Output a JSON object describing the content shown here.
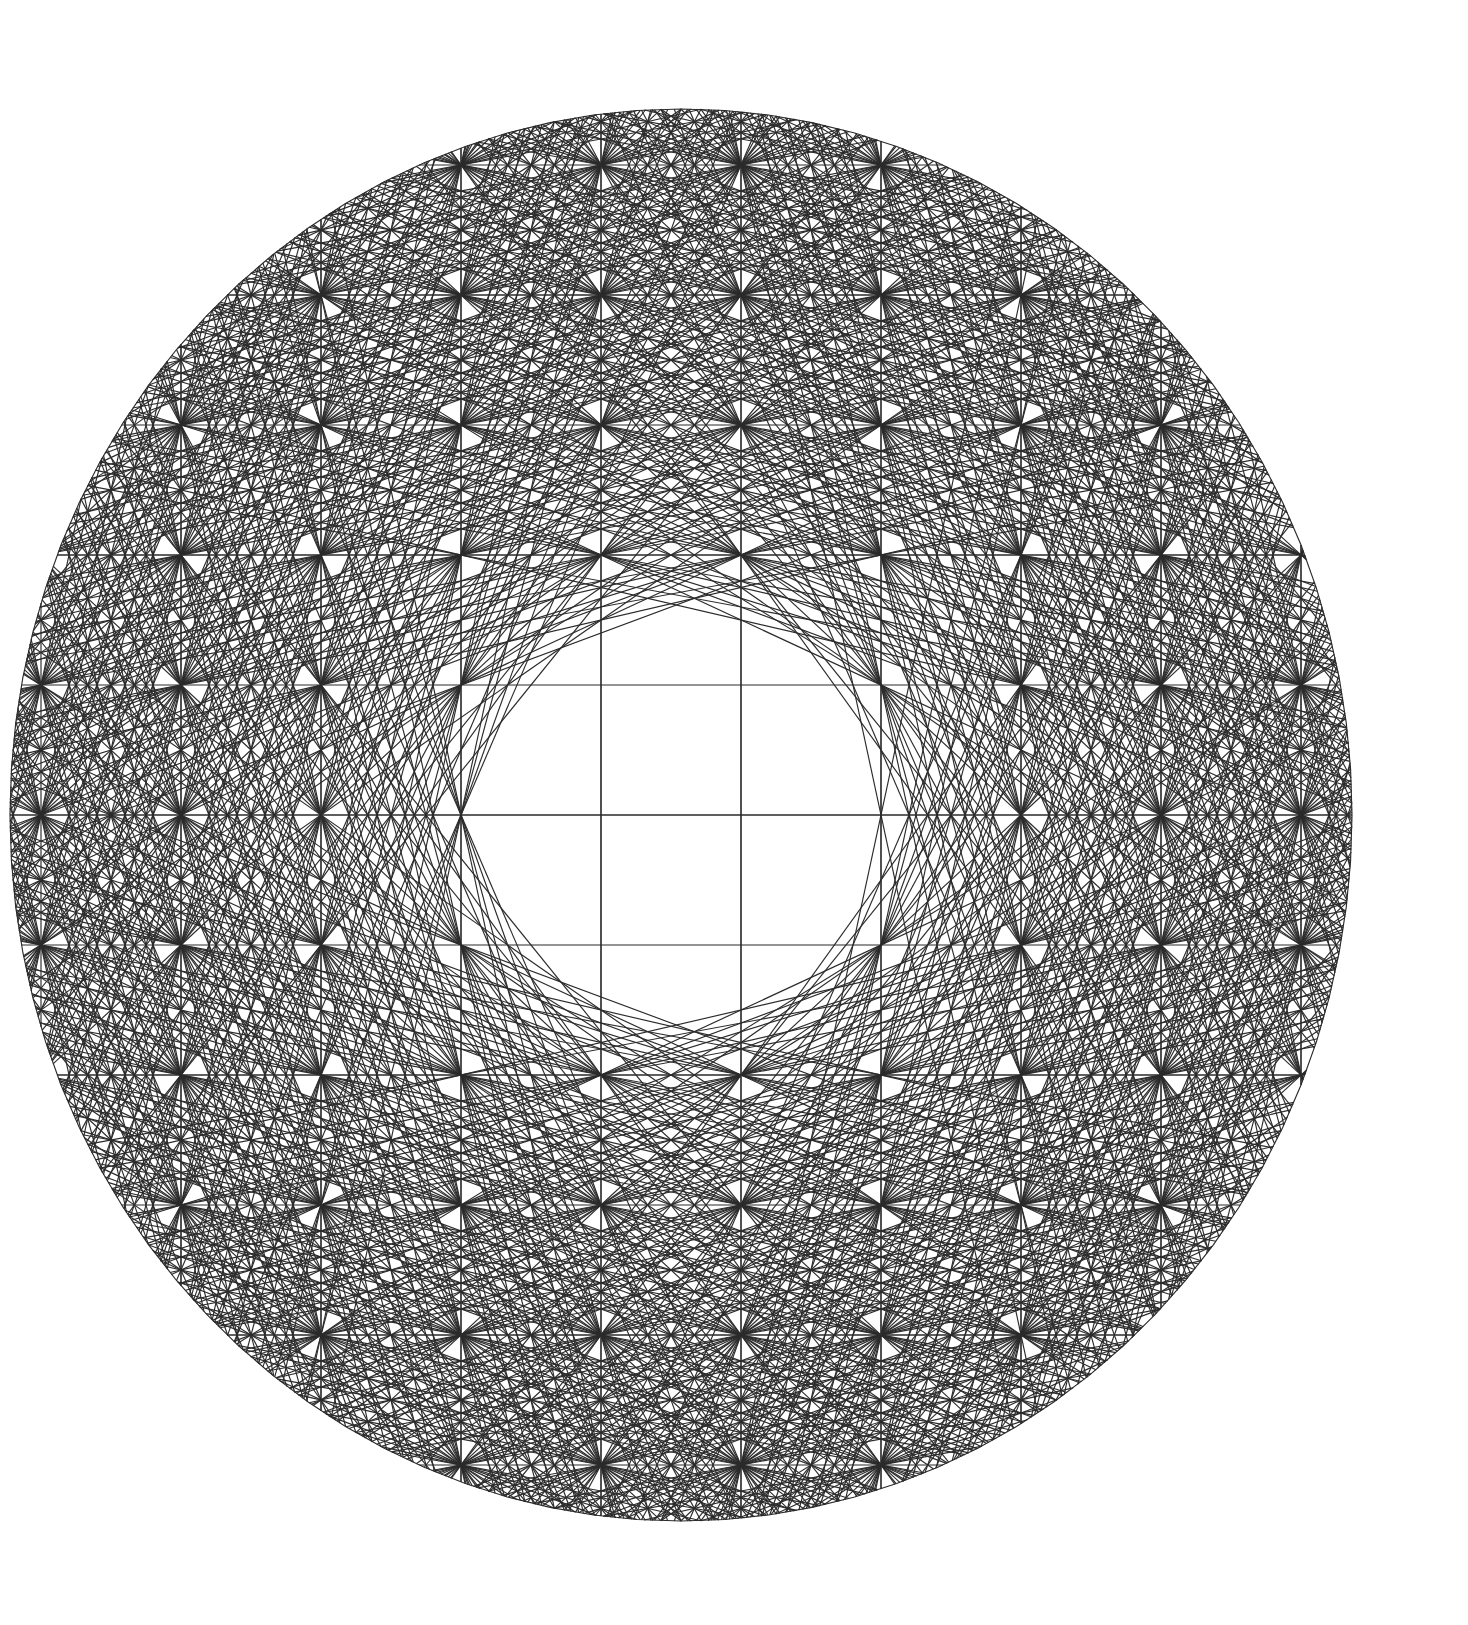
{
  "figure": {
    "title": "Lattice chord circle diagram",
    "kind": "geometric-line-art",
    "background_color": "#ffffff",
    "stroke_color": "#2b2b2b",
    "stroke_width": 1.15,
    "canvas": {
      "width": 1468,
      "height": 1625
    }
  },
  "chart_data": {
    "type": "scatter",
    "title": "Lattice chord circle diagram",
    "subtitle": "",
    "xlabel": "",
    "ylabel": "",
    "grid": true,
    "legend": null,
    "annotations": [],
    "geometry": {
      "shape": "ellipse",
      "center": {
        "x": 681,
        "y": 815
      },
      "radius_x": 671,
      "radius_y": 706,
      "boundary_segments": 96,
      "boundary_label": "outer circle"
    },
    "lattice": {
      "description": "square grid of interior nodes clipped to the circle",
      "spacing_x": 140,
      "spacing_y": 130,
      "origin_x": 681,
      "origin_y": 815,
      "columns_x": [
        41,
        181,
        321,
        461,
        601,
        741,
        881,
        1021,
        1161,
        1301
      ],
      "rows_y": [
        165,
        295,
        425,
        555,
        685,
        815,
        945,
        1075,
        1205,
        1335,
        1465
      ],
      "node_radius": 0
    },
    "chords": {
      "description": "straight chords joining lattice points; slope family dx:dy",
      "slopes": [
        [
          1,
          0
        ],
        [
          0,
          1
        ],
        [
          1,
          1
        ],
        [
          1,
          -1
        ],
        [
          2,
          1
        ],
        [
          2,
          -1
        ],
        [
          1,
          2
        ],
        [
          1,
          -2
        ],
        [
          3,
          1
        ],
        [
          3,
          -1
        ],
        [
          1,
          3
        ],
        [
          1,
          -3
        ],
        [
          3,
          2
        ],
        [
          3,
          -2
        ],
        [
          2,
          3
        ],
        [
          2,
          -3
        ],
        [
          4,
          1
        ],
        [
          4,
          -1
        ],
        [
          1,
          4
        ],
        [
          1,
          -4
        ],
        [
          5,
          2
        ],
        [
          5,
          -2
        ],
        [
          2,
          5
        ],
        [
          2,
          -5
        ],
        [
          4,
          3
        ],
        [
          4,
          -3
        ],
        [
          3,
          4
        ],
        [
          3,
          -4
        ],
        [
          5,
          1
        ],
        [
          5,
          -1
        ],
        [
          1,
          5
        ],
        [
          1,
          -5
        ]
      ],
      "inner_clear_radius": 195,
      "count_estimate": 640
    },
    "axis_lines": {
      "horizontal_rows_drawn": [
        295,
        555,
        815,
        1075,
        1335
      ],
      "vertical_columns_drawn": [
        181,
        321,
        461,
        601,
        741,
        881,
        1021,
        1161,
        1301
      ]
    },
    "x": [],
    "values": []
  }
}
